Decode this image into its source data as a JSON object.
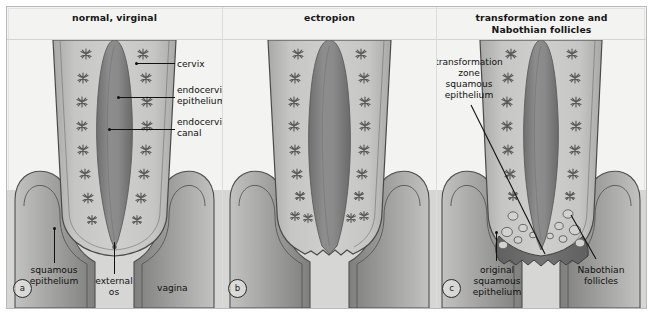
{
  "figure": {
    "kind": "medical-diagram",
    "panel_count": 3
  },
  "panels": [
    {
      "letter": "a",
      "title": "normal, virginal",
      "labels": [
        {
          "name": "cervix",
          "text": "cervix"
        },
        {
          "name": "endocervical-epithelium",
          "text": "endocervical\nepithelium"
        },
        {
          "name": "endocervical-canal",
          "text": "endocervical\ncanal"
        },
        {
          "name": "squamous-epithelium",
          "text": "squamous\nepithelium"
        },
        {
          "name": "external-os",
          "text": "external\nos"
        },
        {
          "name": "vagina",
          "text": "vagina"
        }
      ]
    },
    {
      "letter": "b",
      "title": "ectropion",
      "labels": []
    },
    {
      "letter": "c",
      "title": "transformation zone and\nNabothian follicles",
      "title_line1": "transformation zone and",
      "title_line2": "Nabothian follicles",
      "labels": [
        {
          "name": "transformation-zone-squamous-epithelium",
          "text": "transformation\nzone\nsquamous\nepithelium"
        },
        {
          "name": "original-squamous-epithelium",
          "text": "original\nsquamous\nepithelium"
        },
        {
          "name": "nabothian-follicles",
          "text": "Nabothian\nfollicles"
        }
      ]
    }
  ],
  "label_text": {
    "cervix": "cervix",
    "endocervical_epithelium_l1": "endocervical",
    "endocervical_epithelium_l2": "epithelium",
    "endocervical_canal_l1": "endocervical",
    "endocervical_canal_l2": "canal",
    "squamous_epithelium_l1": "squamous",
    "squamous_epithelium_l2": "epithelium",
    "external_os_l1": "external",
    "external_os_l2": "os",
    "vagina": "vagina",
    "tz_l1": "transformation",
    "tz_l2": "zone",
    "tz_l3": "squamous",
    "tz_l4": "epithelium",
    "orig_l1": "original",
    "orig_l2": "squamous",
    "orig_l3": "epithelium",
    "nab_l1": "Nabothian",
    "nab_l2": "follicles"
  },
  "colors": {
    "page_background": "#ffffff",
    "panel_background": "#f3f3f1",
    "frame_border": "#b9b9b9",
    "divider": "#dcdcd8",
    "cervix_stroke": "#4a4a4a",
    "cervix_fill_light": "#c9c9c7",
    "cervix_fill_mid": "#b2b2b0",
    "canal_dark": "#7e7e7e",
    "canal_darker": "#6b6b6b",
    "gland_stroke": "#5e5e5e",
    "vagina_fill": "#bdbdbb",
    "vagina_shadow": "#8e8e8c",
    "transformation_zone": "#6d6d6d",
    "follicle_fill": "#cfcfcd",
    "label_text": "#111111",
    "leader_line": "#111111"
  }
}
